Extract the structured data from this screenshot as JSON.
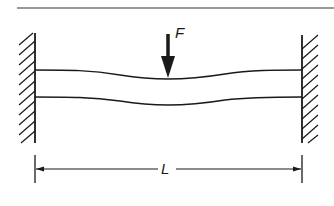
{
  "diagram": {
    "labels": {
      "force": "F",
      "length": "L"
    },
    "elements": {
      "left_support": "fixed wall (hatched)",
      "right_support": "fixed wall (hatched)",
      "beam": "deflected beam",
      "load": "downward point force at midspan",
      "dimension": "span length between supports"
    },
    "colors": {
      "ink": "#1a1a1a",
      "background": "#ffffff"
    }
  }
}
